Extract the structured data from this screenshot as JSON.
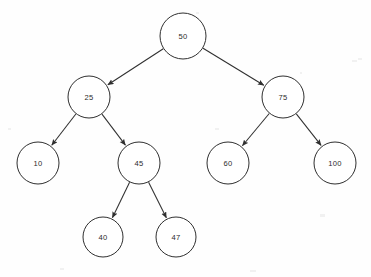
{
  "diagram": {
    "kind": "binary-search-tree",
    "canvas": {
      "width": 371,
      "height": 277,
      "background": "#fefefe"
    },
    "style": {
      "node_fill": "#ffffff",
      "node_stroke": "#2f2f2f",
      "label_color": "#2b2b2b",
      "edge_color": "#2f2f2f",
      "edge_width": 1.05,
      "label_font_size": 7.6,
      "arrowheads": true,
      "edge_style": "straight-arrow"
    },
    "nodes": [
      {
        "id": "n50",
        "label": "50",
        "cx": 183,
        "cy": 36,
        "r": 23,
        "level": 0
      },
      {
        "id": "n25",
        "label": "25",
        "cx": 89,
        "cy": 97,
        "r": 21,
        "level": 1
      },
      {
        "id": "n75",
        "label": "75",
        "cx": 283,
        "cy": 97,
        "r": 21,
        "level": 1
      },
      {
        "id": "n10",
        "label": "10",
        "cx": 38,
        "cy": 163,
        "r": 21,
        "level": 2
      },
      {
        "id": "n45",
        "label": "45",
        "cx": 139,
        "cy": 163,
        "r": 21,
        "level": 2
      },
      {
        "id": "n60",
        "label": "60",
        "cx": 228,
        "cy": 163,
        "r": 21,
        "level": 2
      },
      {
        "id": "n100",
        "label": "100",
        "cx": 335,
        "cy": 163,
        "r": 21,
        "level": 2
      },
      {
        "id": "n40",
        "label": "40",
        "cx": 103,
        "cy": 237,
        "r": 20,
        "level": 3
      },
      {
        "id": "n47",
        "label": "47",
        "cx": 176,
        "cy": 237,
        "r": 20,
        "level": 3
      }
    ],
    "edges": [
      {
        "id": "e50-25",
        "from": "n50",
        "to": "n25",
        "side": "left"
      },
      {
        "id": "e50-75",
        "from": "n50",
        "to": "n75",
        "side": "right"
      },
      {
        "id": "e25-10",
        "from": "n25",
        "to": "n10",
        "side": "left"
      },
      {
        "id": "e25-45",
        "from": "n25",
        "to": "n45",
        "side": "right"
      },
      {
        "id": "e75-60",
        "from": "n75",
        "to": "n60",
        "side": "left"
      },
      {
        "id": "e75-100",
        "from": "n75",
        "to": "n100",
        "side": "right"
      },
      {
        "id": "e45-40",
        "from": "n45",
        "to": "n40",
        "side": "left"
      },
      {
        "id": "e45-47",
        "from": "n45",
        "to": "n47",
        "side": "right"
      }
    ],
    "specks": [
      {
        "x": 352,
        "y": 60,
        "w": 5,
        "h": 2
      },
      {
        "x": 358,
        "y": 58,
        "w": 4,
        "h": 2
      },
      {
        "x": 300,
        "y": 72,
        "w": 2,
        "h": 2
      },
      {
        "x": 8,
        "y": 128,
        "w": 3,
        "h": 2
      },
      {
        "x": 215,
        "y": 128,
        "w": 4,
        "h": 2
      },
      {
        "x": 320,
        "y": 214,
        "w": 5,
        "h": 3
      },
      {
        "x": 60,
        "y": 268,
        "w": 4,
        "h": 2
      },
      {
        "x": 250,
        "y": 270,
        "w": 6,
        "h": 2
      },
      {
        "x": 196,
        "y": 12,
        "w": 3,
        "h": 2
      }
    ]
  }
}
